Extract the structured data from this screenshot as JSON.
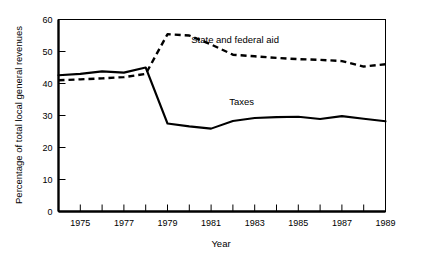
{
  "chart_data": {
    "type": "line",
    "title": "",
    "xlabel": "Year",
    "ylabel": "Percentage of total local general revenues",
    "xlim": [
      1974,
      1989
    ],
    "ylim": [
      0,
      60
    ],
    "grid": false,
    "legend_position": "inline-annotation",
    "x": [
      1974,
      1975,
      1976,
      1977,
      1978,
      1979,
      1980,
      1981,
      1982,
      1983,
      1984,
      1985,
      1986,
      1987,
      1988,
      1989
    ],
    "x_tick_values": [
      1974,
      1975,
      1976,
      1977,
      1978,
      1979,
      1980,
      1981,
      1982,
      1983,
      1984,
      1985,
      1986,
      1987,
      1988,
      1989
    ],
    "x_tick_labels": [
      "",
      "1975",
      "",
      "1977",
      "",
      "1979",
      "",
      "1981",
      "",
      "1983",
      "",
      "1985",
      "",
      "1987",
      "",
      "1989"
    ],
    "y_tick_values": [
      0,
      10,
      20,
      30,
      40,
      50,
      60
    ],
    "y_tick_labels": [
      "0",
      "10",
      "20",
      "30",
      "40",
      "50",
      "60"
    ],
    "series": [
      {
        "name": "State and federal aid",
        "style": "dashed",
        "color": "#000000",
        "label_x": 1982.1,
        "label_y": 52.6,
        "values": [
          41.0,
          41.3,
          41.6,
          42.0,
          43.0,
          55.4,
          55.0,
          52.2,
          49.0,
          48.5,
          48.0,
          47.6,
          47.4,
          47.0,
          45.3,
          46.0
        ]
      },
      {
        "name": "Taxes",
        "style": "solid",
        "color": "#000000",
        "label_x": 1982.4,
        "label_y": 33.2,
        "values": [
          42.6,
          43.0,
          43.8,
          43.4,
          45.0,
          27.5,
          26.6,
          25.9,
          28.3,
          29.2,
          29.5,
          29.6,
          28.9,
          29.8,
          29.0,
          28.2
        ]
      }
    ],
    "annotations": [
      {
        "text": "State and federal aid",
        "x": 1982.1,
        "y": 52.6
      },
      {
        "text": "Taxes",
        "x": 1982.4,
        "y": 33.2
      }
    ]
  }
}
